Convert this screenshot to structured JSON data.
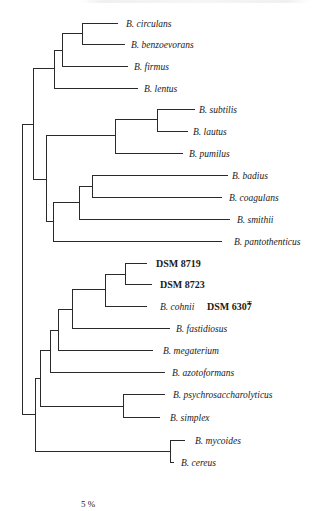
{
  "figure": {
    "type": "phylogenetic-tree",
    "scale_bar_label": "5 %",
    "taxa": [
      {
        "id": "circulans",
        "label": "B. circulans",
        "y": 23,
        "x_end": 118,
        "label_x": 126
      },
      {
        "id": "benzoevorans",
        "label": "B. benzoevorans",
        "y": 44,
        "x_end": 125,
        "label_x": 131
      },
      {
        "id": "firmus",
        "label": "B. firmus",
        "y": 66,
        "x_end": 128,
        "label_x": 134
      },
      {
        "id": "lentus",
        "label": "B. lentus",
        "y": 88,
        "x_end": 138,
        "label_x": 144
      },
      {
        "id": "subtilis",
        "label": "B. subtilis",
        "y": 109,
        "x_end": 195,
        "label_x": 199
      },
      {
        "id": "lautus",
        "label": "B. lautus",
        "y": 131,
        "x_end": 188,
        "label_x": 193
      },
      {
        "id": "pumilus",
        "label": "B. pumilus",
        "y": 153,
        "x_end": 183,
        "label_x": 189
      },
      {
        "id": "badius",
        "label": "B. badius",
        "y": 175,
        "x_end": 228,
        "label_x": 232
      },
      {
        "id": "coagulans",
        "label": "B. coagulans",
        "y": 197,
        "x_end": 222,
        "label_x": 229
      },
      {
        "id": "smithii",
        "label": "B. smithii",
        "y": 219,
        "x_end": 230,
        "label_x": 237
      },
      {
        "id": "pantothenticus",
        "label": "B.  pantothenticus",
        "y": 241,
        "x_end": 222,
        "label_x": 234
      },
      {
        "id": "dsm8719",
        "label": "DSM 8719",
        "y": 263,
        "x_end": 147,
        "label_x": 156,
        "strain": true
      },
      {
        "id": "dsm8723",
        "label": "DSM 8723",
        "y": 284,
        "x_end": 152,
        "label_x": 160,
        "strain": true
      },
      {
        "id": "cohnii",
        "label": "B. cohnii",
        "y": 306,
        "x_end": 147,
        "label_x": 160,
        "type_strain": "DSM 6307",
        "type_strain_sup": "T",
        "type_strain_x": 207
      },
      {
        "id": "fastidiosus",
        "label": "B. fastidiosus",
        "y": 328,
        "x_end": 170,
        "label_x": 176
      },
      {
        "id": "megaterium",
        "label": "B. megaterium",
        "y": 350,
        "x_end": 153,
        "label_x": 163
      },
      {
        "id": "azotoformans",
        "label": "B. azotoformans",
        "y": 372,
        "x_end": 165,
        "label_x": 172
      },
      {
        "id": "psychrosaccharolyticus",
        "label": "B. psychrosaccharolyticus",
        "y": 394,
        "x_end": 165,
        "label_x": 173
      },
      {
        "id": "simplex",
        "label": "B. simplex",
        "y": 417,
        "x_end": 160,
        "label_x": 170
      },
      {
        "id": "mycoides",
        "label": "B. mycoides",
        "y": 440,
        "x_end": 185,
        "label_x": 195
      },
      {
        "id": "cereus",
        "label": "B. cereus",
        "y": 462,
        "x_end": 174,
        "label_x": 181
      }
    ],
    "branches": [
      "M82 23 H118",
      "M82 44 H125",
      "M82 23 V44",
      "M62 33 H82",
      "M62 66 H128",
      "M62 33 V66",
      "M54 50 H62",
      "M54 88 H138",
      "M54 50 V88",
      "M33 68 H54",
      "M33 68 V179",
      "M157 109 H195",
      "M157 131 H188",
      "M157 109 V131",
      "M115 119 H157",
      "M115 153 H183",
      "M115 119 V153",
      "M46 135 H115",
      "M46 135 V221",
      "M33 179 H46",
      "M92 175 H228",
      "M92 197 H222",
      "M92 175 V197",
      "M79 186 H92",
      "M79 219 H230",
      "M79 186 V219",
      "M53 202 H79",
      "M53 241 H222",
      "M53 202 V241",
      "M46 221 H53",
      "M22 124 H33",
      "M22 124 V414",
      "M125 263 H147",
      "M125 284 H152",
      "M125 263 V284",
      "M105 274 H125",
      "M105 306 H147",
      "M105 274 V306",
      "M72 289 H105",
      "M72 328 H170",
      "M72 289 V328",
      "M58 309 H72",
      "M58 350 H153",
      "M58 309 V350",
      "M50 330 H58",
      "M50 372 H165",
      "M50 330 V372",
      "M40 350 H50",
      "M40 350 V406",
      "M123 394 H165",
      "M123 417 H160",
      "M123 394 V417",
      "M40 406 H123",
      "M35 378 H40",
      "M35 378 V451",
      "M170 440 H185",
      "M170 462 H174",
      "M170 440 V462",
      "M35 451 H170",
      "M22 414 H35"
    ],
    "scale_bar": {
      "x": 81,
      "y": 507
    }
  }
}
